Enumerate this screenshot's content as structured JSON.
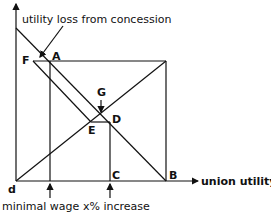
{
  "diagram": {
    "annotation": "utility loss from concession",
    "x_axis_label": "union utility",
    "bottom_labels": {
      "minimal_wage": "minimal wage",
      "x_increase": "x% increase"
    },
    "points": {
      "A": "A",
      "B": "B",
      "C": "C",
      "D": "D",
      "E": "E",
      "F": "F",
      "G": "G",
      "d": "d"
    }
  }
}
